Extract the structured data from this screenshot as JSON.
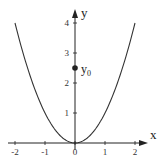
{
  "chart_data": {
    "type": "line",
    "title": "",
    "xlabel": "x",
    "ylabel": "y",
    "xlim": [
      -2,
      2
    ],
    "ylim": [
      0,
      4
    ],
    "grid": false,
    "legend": null,
    "x_ticks": [
      "-2",
      "-1",
      "0",
      "1",
      "2"
    ],
    "y_ticks": [
      "1",
      "2",
      "3",
      "4"
    ],
    "series": [
      {
        "name": "y = x^2",
        "x": [
          -2,
          -1.5,
          -1,
          -0.5,
          0,
          0.5,
          1,
          1.5,
          2
        ],
        "values": [
          4,
          2.25,
          1,
          0.25,
          0,
          0.25,
          1,
          2.25,
          4
        ]
      }
    ],
    "annotations": [
      {
        "label": "y",
        "subscript": "0",
        "x": 0,
        "y": 2.5,
        "marker": "filled-circle"
      }
    ]
  },
  "colors": {
    "curve": "#333333",
    "axis": "#222222",
    "point": "#222222"
  }
}
